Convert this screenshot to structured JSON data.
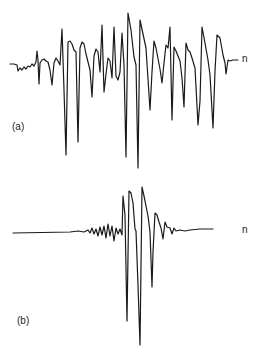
{
  "chart_data": [
    {
      "type": "line",
      "panel": "(a)",
      "title": "",
      "xlabel": "",
      "ylabel": "",
      "grid": false,
      "end_label": "n",
      "description": "Oscillatory waveform trace with repeated large sharp negative deflections (about 13 cycles), starting from a noisy baseline on the left and returning to baseline on the right",
      "points": [
        [
          10,
          64
        ],
        [
          14,
          64
        ],
        [
          17,
          65
        ],
        [
          18,
          71
        ],
        [
          20,
          68
        ],
        [
          22,
          70
        ],
        [
          24,
          67
        ],
        [
          26,
          69
        ],
        [
          28,
          66
        ],
        [
          30,
          67
        ],
        [
          32,
          64
        ],
        [
          34,
          66
        ],
        [
          36,
          62
        ],
        [
          37,
          51
        ],
        [
          38,
          60
        ],
        [
          39,
          84
        ],
        [
          40,
          63
        ],
        [
          42,
          60
        ],
        [
          44,
          59
        ],
        [
          46,
          61
        ],
        [
          48,
          62
        ],
        [
          50,
          70
        ],
        [
          52,
          85
        ],
        [
          54,
          63
        ],
        [
          56,
          58
        ],
        [
          58,
          61
        ],
        [
          60,
          65
        ],
        [
          62,
          29
        ],
        [
          64,
          90
        ],
        [
          66,
          155
        ],
        [
          68,
          42
        ],
        [
          70,
          41
        ],
        [
          72,
          44
        ],
        [
          74,
          50
        ],
        [
          76,
          52
        ],
        [
          78,
          142
        ],
        [
          80,
          48
        ],
        [
          82,
          42
        ],
        [
          84,
          44
        ],
        [
          86,
          54
        ],
        [
          88,
          62
        ],
        [
          90,
          70
        ],
        [
          92,
          97
        ],
        [
          94,
          56
        ],
        [
          96,
          49
        ],
        [
          98,
          52
        ],
        [
          100,
          72
        ],
        [
          102,
          25
        ],
        [
          104,
          92
        ],
        [
          106,
          74
        ],
        [
          108,
          58
        ],
        [
          110,
          61
        ],
        [
          112,
          78
        ],
        [
          114,
          27
        ],
        [
          116,
          76
        ],
        [
          118,
          80
        ],
        [
          120,
          72
        ],
        [
          122,
          33
        ],
        [
          124,
          65
        ],
        [
          126,
          157
        ],
        [
          128,
          13
        ],
        [
          131,
          30
        ],
        [
          134,
          57
        ],
        [
          136,
          65
        ],
        [
          138,
          168
        ],
        [
          140,
          20
        ],
        [
          143,
          34
        ],
        [
          146,
          48
        ],
        [
          150,
          110
        ],
        [
          152,
          72
        ],
        [
          154,
          41
        ],
        [
          156,
          48
        ],
        [
          160,
          69
        ],
        [
          162,
          83
        ],
        [
          164,
          63
        ],
        [
          166,
          45
        ],
        [
          168,
          48
        ],
        [
          170,
          27
        ],
        [
          172,
          120
        ],
        [
          174,
          47
        ],
        [
          176,
          51
        ],
        [
          178,
          56
        ],
        [
          180,
          61
        ],
        [
          182,
          78
        ],
        [
          184,
          107
        ],
        [
          186,
          43
        ],
        [
          188,
          50
        ],
        [
          190,
          52
        ],
        [
          192,
          58
        ],
        [
          195,
          68
        ],
        [
          198,
          125
        ],
        [
          200,
          101
        ],
        [
          202,
          27
        ],
        [
          205,
          43
        ],
        [
          208,
          60
        ],
        [
          210,
          75
        ],
        [
          213,
          128
        ],
        [
          215,
          71
        ],
        [
          217,
          35
        ],
        [
          220,
          38
        ],
        [
          223,
          55
        ],
        [
          225,
          63
        ],
        [
          226,
          74
        ],
        [
          228,
          60
        ],
        [
          230,
          61
        ],
        [
          233,
          60
        ],
        [
          238,
          60
        ]
      ]
    },
    {
      "type": "line",
      "panel": "(b)",
      "title": "",
      "xlabel": "",
      "ylabel": "",
      "grid": false,
      "end_label": "n",
      "description": "Mostly flat baseline with a short burst of small oscillations building into three large sharp negative deflections and large positive peaks near the center, then decaying back to baseline",
      "points": [
        [
          13,
          233
        ],
        [
          70,
          232
        ],
        [
          78,
          231
        ],
        [
          84,
          232
        ],
        [
          88,
          230
        ],
        [
          90,
          233
        ],
        [
          92,
          228
        ],
        [
          94,
          234
        ],
        [
          96,
          229
        ],
        [
          98,
          236
        ],
        [
          100,
          227
        ],
        [
          102,
          235
        ],
        [
          104,
          226
        ],
        [
          106,
          238
        ],
        [
          108,
          224
        ],
        [
          110,
          236
        ],
        [
          112,
          226
        ],
        [
          114,
          241
        ],
        [
          116,
          228
        ],
        [
          118,
          234
        ],
        [
          120,
          229
        ],
        [
          122,
          235
        ],
        [
          123,
          196
        ],
        [
          125,
          215
        ],
        [
          127,
          321
        ],
        [
          129,
          191
        ],
        [
          131,
          193
        ],
        [
          133,
          203
        ],
        [
          135,
          229
        ],
        [
          136,
          231
        ],
        [
          138,
          285
        ],
        [
          140,
          345
        ],
        [
          142,
          187
        ],
        [
          144,
          196
        ],
        [
          146,
          206
        ],
        [
          148,
          216
        ],
        [
          150,
          232
        ],
        [
          152,
          287
        ],
        [
          153,
          252
        ],
        [
          155,
          213
        ],
        [
          157,
          215
        ],
        [
          159,
          222
        ],
        [
          161,
          228
        ],
        [
          163,
          239
        ],
        [
          165,
          222
        ],
        [
          167,
          227
        ],
        [
          170,
          228
        ],
        [
          172,
          234
        ],
        [
          174,
          228
        ],
        [
          176,
          231
        ],
        [
          180,
          230
        ],
        [
          185,
          231
        ],
        [
          190,
          230
        ],
        [
          200,
          229
        ],
        [
          213,
          229
        ]
      ]
    }
  ],
  "figure": {
    "panel_a": {
      "label": "(a)",
      "end_label": "n"
    },
    "panel_b": {
      "label": "(b)",
      "end_label": "n"
    },
    "stroke_color": "#1a1a1a",
    "background": "#ffffff"
  }
}
